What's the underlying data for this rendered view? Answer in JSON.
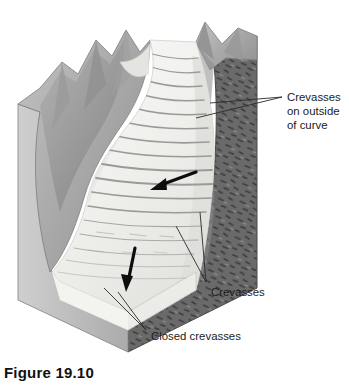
{
  "figure": {
    "caption": "Figure 19.10",
    "background_color": "#ffffff"
  },
  "labels": {
    "crevasses_outside": {
      "line1": "Crevasses",
      "line2": "on outside",
      "line3": "of curve"
    },
    "crevasses": "Crevasses",
    "closed_crevasses": "Closed crevasses"
  },
  "icons": {
    "flow_arrow_upper": "flow-arrow-icon",
    "flow_arrow_lower": "flow-arrow-icon"
  },
  "colors": {
    "bedrock_front": "#6e6e6e",
    "bedrock_side": "#8f8f8f",
    "mountain_light": "#b9b9b9",
    "mountain_mid": "#a0a0a0",
    "mountain_dark": "#8a8a8a",
    "ice_top": "#f0f0ee",
    "ice_shadow": "#d9d9d6",
    "ice_edge": "#e6e6e3",
    "crevasse_line": "#9a9a9a",
    "leader_line": "#2a2a2a",
    "text": "#1c1c1c",
    "caption": "#111111"
  }
}
